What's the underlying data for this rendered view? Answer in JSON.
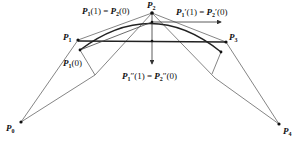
{
  "points": [
    {
      "id": "P0",
      "label": "P",
      "sub": "0",
      "x": 21,
      "y": 122
    },
    {
      "id": "P1",
      "label": "P",
      "sub": "1",
      "x": 78,
      "y": 40
    },
    {
      "id": "P2",
      "label": "P",
      "sub": "2",
      "x": 152,
      "y": 13
    },
    {
      "id": "P3",
      "label": "P",
      "sub": "3",
      "x": 226,
      "y": 42
    },
    {
      "id": "P4",
      "label": "P",
      "sub": "4",
      "x": 279,
      "y": 124
    }
  ],
  "annotations": {
    "top_left": "P₁(1) = P₂(0)",
    "top_right": "P₁′(1) = P₂′(0)",
    "center": "P₁″(1) = P₂″(0)",
    "left_small": "P₁(0)"
  },
  "labels": {
    "p0": "P",
    "p0_sub": "0",
    "p1": "P",
    "p1_sub": "1",
    "p2": "P",
    "p2_sub": "2",
    "p3": "P",
    "p3_sub": "3",
    "p4": "P",
    "p4_sub": "4",
    "eq_top_left_a": "P",
    "eq_top_left_a_sub": "1",
    "eq_top_left_b": "(1) = ",
    "eq_top_left_c": "P",
    "eq_top_left_c_sub": "2",
    "eq_top_left_d": "(0)",
    "eq_top_right_a": "P",
    "eq_top_right_a_sub": "1",
    "eq_top_right_b": "′(1) = ",
    "eq_top_right_c": "P",
    "eq_top_right_c_sub": "2",
    "eq_top_right_d": "′(0)",
    "eq_center_a": "P",
    "eq_center_a_sub": "1",
    "eq_center_b": "″(1) = ",
    "eq_center_c": "P",
    "eq_center_c_sub": "2",
    "eq_center_d": "″(0)",
    "eq_left_a": "P",
    "eq_left_a_sub": "1",
    "eq_left_b": "(0)"
  },
  "colors": {
    "line": "#555555",
    "curve": "#222222",
    "text": "#111111"
  }
}
